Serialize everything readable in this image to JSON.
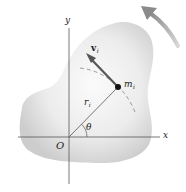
{
  "diagram": {
    "colors": {
      "body_fill_center": "#f7f7f7",
      "body_fill_edge": "#cfcfcf",
      "axis": "#555555",
      "vector": "#555555",
      "rotation_arrow": "#9a9a9a",
      "text": "#222222"
    },
    "labels": {
      "x_axis": "x",
      "y_axis": "y",
      "origin": "O",
      "angle": "θ",
      "position_vector": "r",
      "position_sub": "i",
      "velocity_vector": "v",
      "velocity_sub": "i",
      "mass": "m",
      "mass_sub": "i"
    },
    "points": {
      "origin": [
        69,
        137
      ],
      "mass": [
        118,
        87
      ],
      "velocity_tip": [
        87,
        55
      ]
    }
  }
}
